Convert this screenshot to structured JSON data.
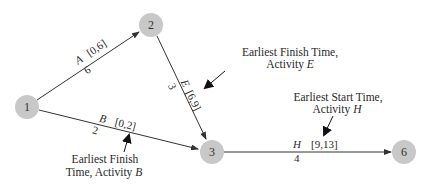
{
  "diagram": {
    "type": "activity-on-arrow network",
    "colors": {
      "node_fill": "#c8c8c8",
      "edge": "#333333",
      "text": "#2a2a2a"
    },
    "nodes": [
      {
        "id": "1",
        "label": "1",
        "x": 27,
        "y": 107
      },
      {
        "id": "2",
        "label": "2",
        "x": 151,
        "y": 25
      },
      {
        "id": "3",
        "label": "3",
        "x": 212,
        "y": 152
      },
      {
        "id": "6",
        "label": "6",
        "x": 404,
        "y": 152
      }
    ],
    "edges": [
      {
        "from": "1",
        "to": "2",
        "activity": "A",
        "duration": "6",
        "times": "[0,6]"
      },
      {
        "from": "1",
        "to": "3",
        "activity": "B",
        "duration": "2",
        "times": "[0,2]"
      },
      {
        "from": "2",
        "to": "3",
        "activity": "E",
        "duration": "3",
        "times": "[6,9]"
      },
      {
        "from": "3",
        "to": "6",
        "activity": "H",
        "duration": "4",
        "times": "[9,13]"
      }
    ],
    "annotations": {
      "e_finish": {
        "line1": "Earliest Finish Time,",
        "line2_prefix": "Activity ",
        "line2_var": "E"
      },
      "h_start": {
        "line1": "Earliest Start Time,",
        "line2_prefix": "Activity ",
        "line2_var": "H"
      },
      "b_finish": {
        "line1": "Earliest Finish",
        "line2_prefix": "Time, Activity ",
        "line2_var": "B"
      }
    }
  }
}
